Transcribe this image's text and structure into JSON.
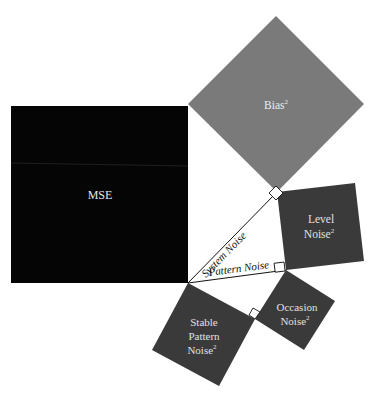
{
  "colors": {
    "background": "#ffffff",
    "mse": "#050505",
    "bias": "#7a7a7a",
    "noise": "#3a3a3a",
    "label_light": "#e6e6e6",
    "line": "#111111"
  },
  "squares": {
    "mse": {
      "label": "MSE"
    },
    "bias": {
      "label": "Bias",
      "sup": "2"
    },
    "level": {
      "line1": "Level",
      "line2": "Noise",
      "sup": "2"
    },
    "occasion": {
      "line1": "Occasion",
      "line2": "Noise",
      "sup": "2"
    },
    "stable": {
      "line1": "Stable",
      "line2": "Pattern",
      "line3": "Noise",
      "sup": "2"
    }
  },
  "edges": {
    "system_noise": "System Noise",
    "pattern_noise": "Pattern Noise"
  }
}
